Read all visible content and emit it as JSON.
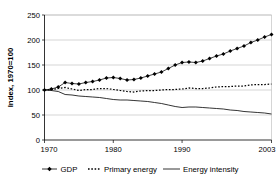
{
  "chart_data": {
    "type": "line",
    "title": "",
    "xlabel": "",
    "ylabel": "Index, 1970=100",
    "xlim": [
      1970,
      2003
    ],
    "ylim": [
      0,
      250
    ],
    "yticks": [
      0,
      50,
      100,
      150,
      200,
      250
    ],
    "xticks": [
      1970,
      1980,
      1990,
      2003
    ],
    "xtick_labels": [
      "1970",
      "1980",
      "1990",
      "2003"
    ],
    "ytick_labels": [
      "0",
      "50",
      "100",
      "150",
      "200",
      "250"
    ],
    "grid": "horizontal",
    "legend_position": "bottom",
    "x": [
      1970,
      1971,
      1972,
      1973,
      1974,
      1975,
      1976,
      1977,
      1978,
      1979,
      1980,
      1981,
      1982,
      1983,
      1984,
      1985,
      1986,
      1987,
      1988,
      1989,
      1990,
      1991,
      1992,
      1993,
      1994,
      1995,
      1996,
      1997,
      1998,
      1999,
      2000,
      2001,
      2002,
      2003
    ],
    "series": [
      {
        "name": "GDP",
        "marker": "diamond",
        "style": "line-with-markers",
        "values": [
          100,
          102,
          106,
          115,
          113,
          112,
          115,
          117,
          120,
          124,
          125,
          123,
          120,
          121,
          124,
          128,
          132,
          136,
          143,
          150,
          155,
          156,
          155,
          158,
          163,
          168,
          172,
          178,
          183,
          188,
          195,
          200,
          206,
          211
        ]
      },
      {
        "name": "Primary energy",
        "marker": "none",
        "style": "dotted",
        "values": [
          100,
          101,
          103,
          105,
          102,
          99,
          101,
          101,
          103,
          103,
          101,
          99,
          97,
          96,
          98,
          99,
          99,
          100,
          101,
          101,
          102,
          104,
          103,
          103,
          104,
          106,
          107,
          107,
          108,
          108,
          110,
          111,
          111,
          112
        ]
      },
      {
        "name": "Energy intensity",
        "marker": "none",
        "style": "solid",
        "values": [
          100,
          99,
          97,
          91,
          90,
          88,
          87,
          86,
          85,
          83,
          81,
          80,
          80,
          79,
          78,
          77,
          75,
          73,
          70,
          67,
          65,
          66,
          66,
          65,
          64,
          63,
          62,
          60,
          59,
          57,
          56,
          55,
          54,
          52
        ]
      }
    ]
  },
  "legend": {
    "items": [
      {
        "label": "GDP",
        "marker": "diamond"
      },
      {
        "label": "Primary energy",
        "marker": "dotted-line"
      },
      {
        "label": "Energy intensity",
        "marker": "solid-line"
      }
    ]
  }
}
